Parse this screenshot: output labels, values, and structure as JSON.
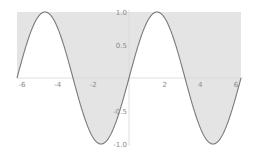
{
  "chart_data": {
    "type": "area",
    "title": "",
    "xlabel": "",
    "ylabel": "",
    "function": "sin(x)",
    "fill": "between curve and y=1",
    "xlim": [
      -6.2832,
      6.2832
    ],
    "ylim": [
      -1.0,
      1.0
    ],
    "x_ticks": [
      -6,
      -4,
      -2,
      2,
      4,
      6
    ],
    "x_tick_labels": [
      "-6",
      "-4",
      "-2",
      "2",
      "4",
      "6"
    ],
    "y_ticks": [
      1.0,
      0.5,
      -0.5,
      -1.0
    ],
    "y_tick_labels": [
      "1.0",
      "0.5",
      "-0.5",
      "-1.0"
    ],
    "series": [
      {
        "name": "sin(x)",
        "x": [
          -6.2832,
          -5.4978,
          -4.7124,
          -3.927,
          -3.1416,
          -2.3562,
          -1.5708,
          -0.7854,
          0,
          0.7854,
          1.5708,
          2.3562,
          3.1416,
          3.927,
          4.7124,
          5.4978,
          6.2832
        ],
        "y": [
          0,
          0.7071,
          1,
          0.7071,
          0,
          -0.7071,
          -1,
          -0.7071,
          0,
          0.7071,
          1,
          0.7071,
          0,
          -0.7071,
          -1,
          -0.7071,
          0
        ]
      }
    ],
    "grid": false,
    "legend": "none",
    "colors": {
      "curve": "#7a7a7a",
      "fill": "#e4e4e4",
      "axis": "#d8d8d8",
      "label": "#8a8a8a"
    }
  }
}
